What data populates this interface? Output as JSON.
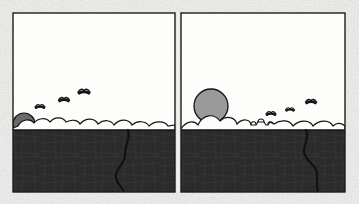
{
  "artwork": {
    "title": "Two-panel landscape sequence",
    "medium": "pen and ink drawing",
    "paper_color": "#f2f1ef",
    "ink_color": "#1d1d1d",
    "sky_color": "#fdfdfc",
    "ground_color": "#2b2b2b",
    "sun_fill": "#9a9a9a",
    "sun_fill_dark": "#6b6b6b",
    "panel_count": 2
  },
  "frame": {
    "x": 13,
    "y": 13,
    "width": 332,
    "height": 179,
    "divider_x": 178,
    "border_color": "#1d1d1d",
    "border_width": 1.4
  },
  "panels": [
    {
      "name": "panel-left",
      "caption": "Left panel — low sun at horizon",
      "x": 13,
      "y": 13,
      "width": 162,
      "height": 179,
      "horizon_y": 130,
      "sun": {
        "name": "low-sun",
        "cx": 24,
        "cy": 124,
        "r": 11,
        "fill": "#6b6b6b",
        "state": "partially risen behind horizon"
      },
      "birds": [
        {
          "x": 40,
          "y": 106,
          "scale": 1.0
        },
        {
          "x": 64,
          "y": 99,
          "scale": 1.1
        },
        {
          "x": 84,
          "y": 91,
          "scale": 1.2
        }
      ],
      "river": {
        "name": "river-left",
        "path": "M 128 130 C 131 140, 124 146, 125 154 C 126 162, 118 166, 116 174 C 114 182, 122 186, 124 192",
        "stroke": "#111111",
        "width": 2.1
      },
      "cloud_band_path": "M 13 128 L 18 126 C 22 119, 30 118, 34 123 C 38 118, 46 117, 50 122 C 55 116, 63 117, 66 122 C 72 119, 78 120, 80 124 C 86 117, 95 118, 98 124 C 104 119, 111 120, 114 125 C 120 118, 129 119, 132 125 C 138 120, 146 121, 149 126 C 155 120, 165 121, 168 126 L 175 125 L 175 130 L 13 130 Z"
    },
    {
      "name": "panel-right",
      "caption": "Right panel — risen full sun above horizon",
      "x": 181,
      "y": 13,
      "width": 164,
      "height": 179,
      "horizon_y": 130,
      "sun": {
        "name": "risen-sun",
        "cx": 211,
        "cy": 106,
        "r": 17,
        "fill": "#9a9a9a",
        "state": "fully risen above horizon"
      },
      "birds": [
        {
          "x": 271,
          "y": 113,
          "scale": 1.0
        },
        {
          "x": 290,
          "y": 109,
          "scale": 0.9
        },
        {
          "x": 311,
          "y": 101,
          "scale": 1.1
        }
      ],
      "structures": [
        {
          "name": "hut-left",
          "x": 251,
          "y": 122,
          "w": 5,
          "h": 8
        },
        {
          "name": "hut-mid",
          "x": 258,
          "y": 120,
          "w": 6,
          "h": 10
        },
        {
          "name": "hut-right",
          "x": 268,
          "y": 123,
          "w": 5,
          "h": 7
        },
        {
          "name": "post",
          "x": 276,
          "y": 124,
          "w": 3,
          "h": 6
        }
      ],
      "river": {
        "name": "river-right",
        "path": "M 306 130 C 310 139, 303 145, 304 152 C 305 160, 313 163, 316 170 C 319 177, 315 184, 318 192",
        "stroke": "#111111",
        "width": 2.1
      },
      "cloud_band_path": "M 181 128 C 186 121, 194 120, 198 125 C 203 114, 214 113, 220 121 C 226 115, 235 117, 237 124 C 243 118, 252 119, 255 125 C 262 118, 271 119, 274 125 C 281 119, 290 120, 293 126 C 300 119, 310 120, 313 126 C 320 119, 330 120, 333 126 C 337 122, 342 123, 345 126 L 345 130 L 181 130 Z"
    }
  ],
  "labels": {
    "left_panel_name": "panel-left",
    "right_panel_name": "panel-right"
  }
}
